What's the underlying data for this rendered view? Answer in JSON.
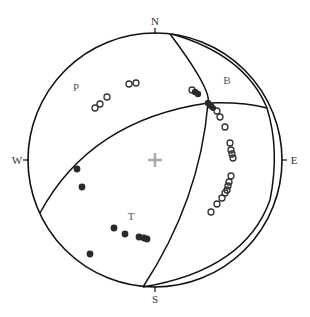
{
  "diagram": {
    "type": "stereonet",
    "directions": {
      "north": "N",
      "south": "S",
      "east": "E",
      "west": "W"
    },
    "field_labels": {
      "p": "P",
      "t": "T",
      "b": "B"
    },
    "center_icon": "plus-icon",
    "colors": {
      "line": "#111111",
      "open_symbol": "#333333",
      "filled_symbol": "#2a2a2a",
      "center": "#aaaaaa"
    }
  },
  "legend_symbols": {
    "open_circle": "P axes",
    "filled_circle": "T axes"
  }
}
